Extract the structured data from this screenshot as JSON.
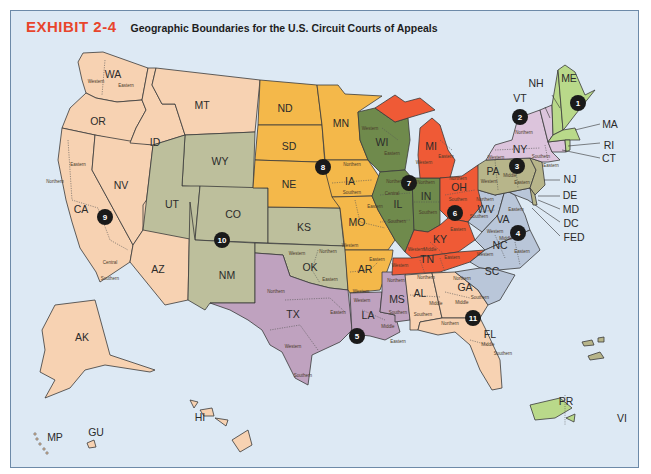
{
  "header": {
    "exhibit_label": "EXHIBIT 2-4",
    "title": "Geographic Boundaries for the U.S. Circuit Courts of Appeals"
  },
  "colors": {
    "water": "#dde9f4",
    "border": "#6d8aa8",
    "exhibit_red": "#e8452c",
    "circuit_1": "#b9d98a",
    "circuit_2": "#dcc4dc",
    "circuit_3": "#b7b58a",
    "circuit_4": "#b9c6d9",
    "circuit_5": "#bfa2bf",
    "circuit_6": "#ef5a36",
    "circuit_7": "#6f8a4c",
    "circuit_8": "#f4b84a",
    "circuit_9": "#f7d2b2",
    "circuit_10": "#bdbf9c",
    "circuit_11": "#f7d2b2"
  },
  "circuits": [
    {
      "number": "1",
      "states": [
        "ME",
        "NH",
        "MA",
        "RI",
        "PR"
      ]
    },
    {
      "number": "2",
      "states": [
        "VT",
        "NY",
        "CT"
      ]
    },
    {
      "number": "3",
      "states": [
        "PA",
        "NJ",
        "DE",
        "VI"
      ]
    },
    {
      "number": "4",
      "states": [
        "MD",
        "WV",
        "VA",
        "NC",
        "SC"
      ]
    },
    {
      "number": "5",
      "states": [
        "TX",
        "LA",
        "MS"
      ]
    },
    {
      "number": "6",
      "states": [
        "OH",
        "MI",
        "KY",
        "TN"
      ]
    },
    {
      "number": "7",
      "states": [
        "WI",
        "IL",
        "IN"
      ]
    },
    {
      "number": "8",
      "states": [
        "ND",
        "SD",
        "NE",
        "MN",
        "IA",
        "MO",
        "AR"
      ]
    },
    {
      "number": "9",
      "states": [
        "WA",
        "OR",
        "CA",
        "NV",
        "ID",
        "MT",
        "AZ",
        "AK",
        "HI",
        "GU",
        "MP"
      ]
    },
    {
      "number": "10",
      "states": [
        "WY",
        "UT",
        "CO",
        "KS",
        "OK",
        "NM"
      ]
    },
    {
      "number": "11",
      "states": [
        "AL",
        "GA",
        "FL"
      ]
    }
  ],
  "state_labels": {
    "WA": "WA",
    "OR": "OR",
    "CA": "CA",
    "NV": "NV",
    "ID": "ID",
    "MT": "MT",
    "AZ": "AZ",
    "WY": "WY",
    "UT": "UT",
    "CO": "CO",
    "NM": "NM",
    "KS": "KS",
    "OK": "OK",
    "ND": "ND",
    "SD": "SD",
    "NE": "NE",
    "MN": "MN",
    "IA": "IA",
    "MO": "MO",
    "AR": "AR",
    "TX": "TX",
    "LA": "LA",
    "MS": "MS",
    "WI": "WI",
    "IL": "IL",
    "IN": "IN",
    "MI": "MI",
    "OH": "OH",
    "KY": "KY",
    "TN": "TN",
    "AL": "AL",
    "GA": "GA",
    "FL": "FL",
    "SC": "SC",
    "NC": "NC",
    "VA": "VA",
    "WV": "WV",
    "PA": "PA",
    "NY": "NY",
    "ME": "ME",
    "NH": "NH",
    "VT": "VT",
    "MA": "MA",
    "RI": "RI",
    "CT": "CT",
    "NJ": "NJ",
    "DE": "DE",
    "MD": "MD",
    "DC": "DC",
    "FED": "FED",
    "AK": "AK",
    "HI": "HI",
    "GU": "GU",
    "MP": "MP",
    "PR": "PR",
    "VI": "VI"
  },
  "districts": {
    "WA": [
      "Western",
      "Eastern"
    ],
    "CA": [
      "Northern",
      "Eastern",
      "Central",
      "Southern"
    ],
    "WI": [
      "Western",
      "Eastern"
    ],
    "IA": [
      "Northern",
      "Southern"
    ],
    "IL": [
      "Northern",
      "Central",
      "Southern"
    ],
    "IN": [
      "Northern",
      "Southern"
    ],
    "MI": [
      "Western",
      "Eastern"
    ],
    "OH": [
      "Northern",
      "Southern"
    ],
    "KY": [
      "Western",
      "Eastern"
    ],
    "TN": [
      "Western",
      "Middle",
      "Eastern"
    ],
    "MO": [
      "Eastern",
      "Western"
    ],
    "AR": [
      "Eastern",
      "Western"
    ],
    "OK": [
      "Western",
      "Northern",
      "Eastern"
    ],
    "TX": [
      "Northern",
      "Eastern",
      "Western",
      "Southern"
    ],
    "LA": [
      "Western",
      "Middle",
      "Eastern"
    ],
    "MS": [
      "Northern",
      "Southern"
    ],
    "AL": [
      "Northern",
      "Middle",
      "Southern"
    ],
    "GA": [
      "Northern",
      "Middle",
      "Southern"
    ],
    "FL": [
      "Northern",
      "Middle",
      "Southern"
    ],
    "NY": [
      "Western",
      "Northern",
      "Southern",
      "Eastern"
    ],
    "PA": [
      "Western",
      "Middle",
      "Eastern"
    ],
    "WV": [
      "Northern",
      "Southern"
    ],
    "VA": [
      "Western",
      "Eastern"
    ],
    "NC": [
      "Western",
      "Middle",
      "Eastern"
    ]
  },
  "badges": [
    "1",
    "2",
    "3",
    "4",
    "5",
    "6",
    "7",
    "8",
    "9",
    "10",
    "11"
  ]
}
